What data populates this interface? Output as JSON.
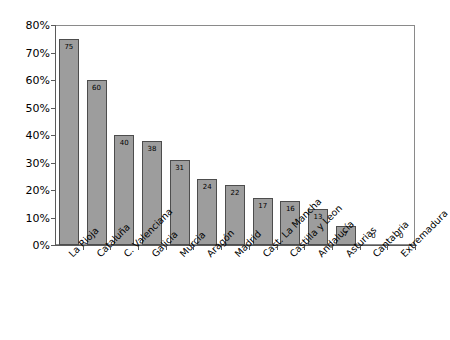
{
  "chart_data": {
    "type": "bar",
    "title": "",
    "subtitle": "",
    "xlabel": "",
    "ylabel": "",
    "ylim": [
      0,
      80
    ],
    "y_tick_labels": [
      "0%",
      "10%",
      "20%",
      "30%",
      "40%",
      "50%",
      "60%",
      "70%",
      "80%"
    ],
    "y_tick_values": [
      0,
      10,
      20,
      30,
      40,
      50,
      60,
      70,
      80
    ],
    "grid": false,
    "legend": "none",
    "value_label_position": "inside-top",
    "categories": [
      "La Rioja",
      "Cataluña",
      "C. Valenciana",
      "Galicia",
      "Murcia",
      "Aragón",
      "Madrid",
      "Cast. La Mancha",
      "Castilla y Leon",
      "Andalucía",
      "Asturias",
      "Cantabria",
      "Extremadura"
    ],
    "values": [
      75,
      60,
      40,
      38,
      31,
      24,
      22,
      17,
      16,
      13,
      7,
      0,
      0
    ],
    "value_labels": [
      "75",
      "60",
      "40",
      "38",
      "31",
      "24",
      "22",
      "17",
      "16",
      "13",
      "7",
      "0",
      "0"
    ],
    "colors": {
      "bar_fill": "#9d9d9d",
      "bar_border": "#4d4d4d",
      "axis": "#5a5a5a",
      "plot_border": "#8a8a8a",
      "background": "#ffffff",
      "text": "#000000"
    }
  }
}
